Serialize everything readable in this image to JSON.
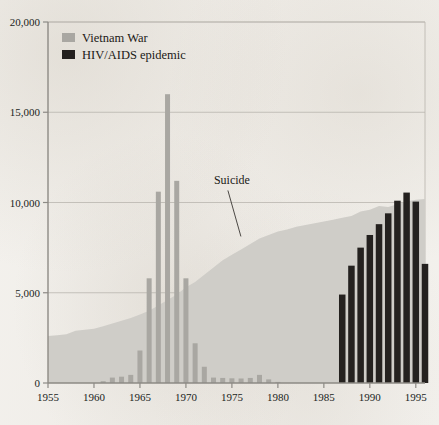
{
  "chart_data": {
    "type": "bar",
    "title": "",
    "subtitle": "",
    "xlabel": "",
    "ylabel": "",
    "xlim": [
      1955,
      1996
    ],
    "ylim": [
      0,
      20000
    ],
    "grid": true,
    "legend_position": "top-left",
    "y_ticks": [
      0,
      5000,
      10000,
      15000,
      20000
    ],
    "y_tick_labels": [
      "0",
      "5,000",
      "10,000",
      "15,000",
      "20,000"
    ],
    "x_ticks": [
      1955,
      1960,
      1965,
      1970,
      1975,
      1980,
      1985,
      1990,
      1995
    ],
    "x_tick_labels": [
      "1955",
      "1960",
      "1965",
      "1970",
      "1975",
      "1980",
      "1985",
      "1990",
      "1995"
    ],
    "series": [
      {
        "name": "Suicide",
        "type": "area",
        "color": "#cfcdc8",
        "x": [
          1955,
          1956,
          1957,
          1958,
          1959,
          1960,
          1961,
          1962,
          1963,
          1964,
          1965,
          1966,
          1967,
          1968,
          1969,
          1970,
          1971,
          1972,
          1973,
          1974,
          1975,
          1976,
          1977,
          1978,
          1979,
          1980,
          1981,
          1982,
          1983,
          1984,
          1985,
          1986,
          1987,
          1988,
          1989,
          1990,
          1991,
          1992,
          1993,
          1994,
          1995,
          1996
        ],
        "values": [
          2600,
          2650,
          2700,
          2900,
          2950,
          3000,
          3150,
          3300,
          3450,
          3600,
          3800,
          4000,
          4300,
          4600,
          4900,
          5300,
          5600,
          6000,
          6400,
          6800,
          7100,
          7400,
          7700,
          8000,
          8200,
          8400,
          8500,
          8650,
          8750,
          8850,
          8950,
          9050,
          9150,
          9250,
          9500,
          9600,
          9800,
          9750,
          9900,
          10050,
          10150,
          10200
        ]
      },
      {
        "name": "Vietnam War",
        "type": "bar",
        "color": "#a9a7a2",
        "x": [
          1961,
          1962,
          1963,
          1964,
          1965,
          1966,
          1967,
          1968,
          1969,
          1970,
          1971,
          1972,
          1973,
          1974,
          1975,
          1976,
          1977,
          1978,
          1979,
          1980
        ],
        "values": [
          100,
          300,
          350,
          450,
          1800,
          5800,
          10600,
          16000,
          11200,
          5800,
          2200,
          900,
          300,
          280,
          260,
          250,
          280,
          450,
          200,
          60
        ]
      },
      {
        "name": "HIV/AIDS epidemic",
        "type": "bar",
        "color": "#24211f",
        "x": [
          1987,
          1988,
          1989,
          1990,
          1991,
          1992,
          1993,
          1994,
          1995,
          1996
        ],
        "values": [
          4900,
          6500,
          7500,
          8200,
          8800,
          9400,
          10100,
          10550,
          10050,
          6600
        ]
      }
    ],
    "annotations": [
      {
        "text": "Suicide",
        "x": 1975,
        "y": 11000
      }
    ]
  },
  "legend": {
    "items": [
      {
        "label": "Vietnam War",
        "color": "#a9a7a2"
      },
      {
        "label": "HIV/AIDS epidemic",
        "color": "#24211f"
      }
    ]
  }
}
